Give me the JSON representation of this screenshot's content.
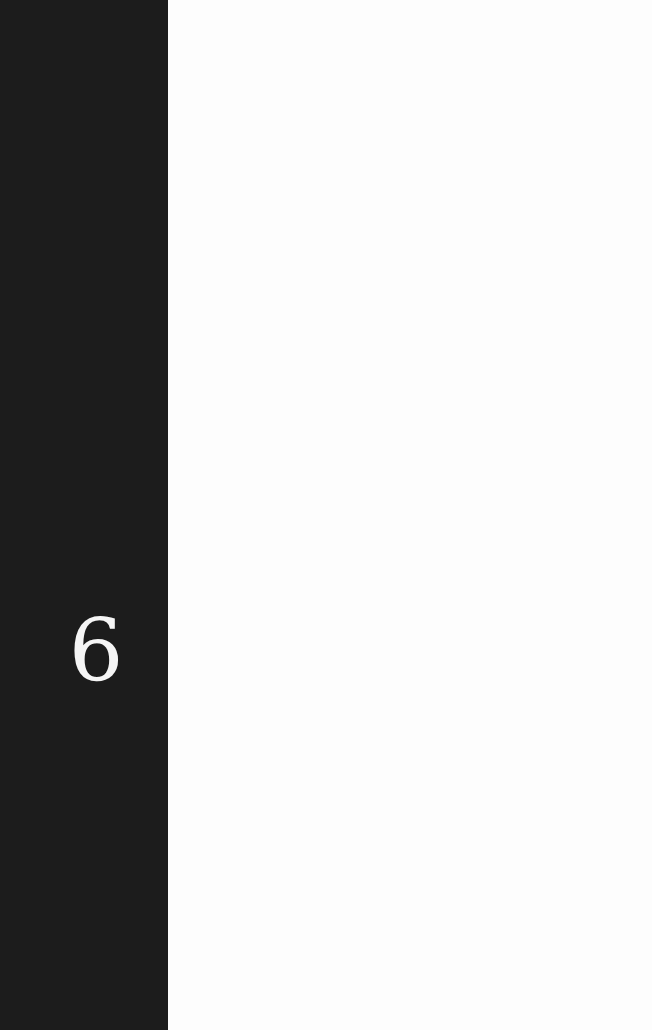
{
  "page": {
    "chapter_number": "6",
    "colors": {
      "band": "#1c1c1c",
      "page": "#fdfdfd",
      "number": "#f5f5f5"
    }
  }
}
